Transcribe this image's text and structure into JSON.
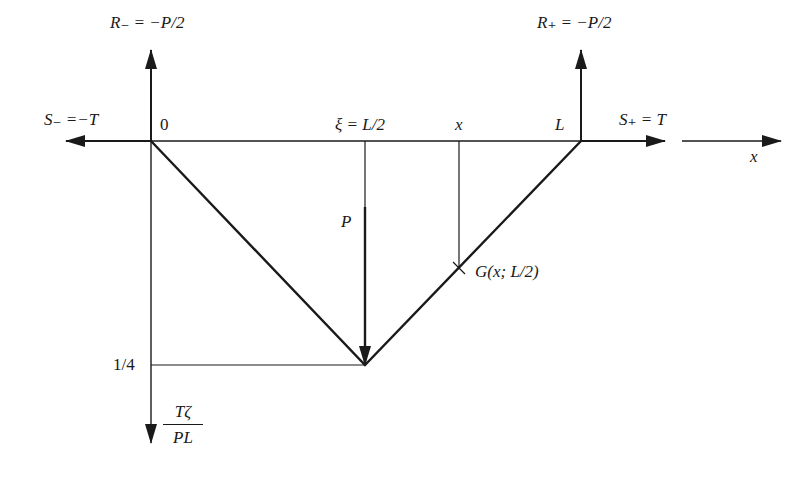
{
  "labels": {
    "r_minus": "R₋ = −P/2",
    "r_plus": "R₊ = −P/2",
    "s_minus": "S₋ =−T",
    "s_plus": "S₊ = T",
    "origin": "0",
    "xi": "ξ = L/2",
    "x_mark": "x",
    "L_mark": "L",
    "x_axis": "x",
    "load": "P",
    "green": "G(x; L/2)",
    "quarter": "1/4",
    "y_axis_num": "Tζ",
    "y_axis_den": "PL"
  },
  "geometry": {
    "origin": [
      151,
      141
    ],
    "right_support": [
      581,
      141
    ],
    "apex": [
      365,
      365
    ],
    "x_sample": 459,
    "apex_value": "1/4"
  },
  "colors": {
    "ink": "#1a1a1a",
    "background": "#ffffff"
  }
}
